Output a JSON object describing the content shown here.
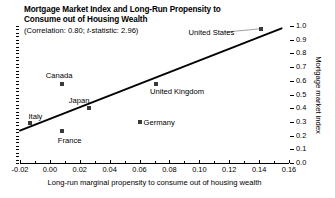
{
  "chart_data": {
    "type": "scatter",
    "title": "Mortgage Market Index and Long-Run Propensity to Consume out of Housing Wealth",
    "title_line1": "Mortgage Market Index and Long-Run Propensity to",
    "title_line2": "Consume out of Housing Wealth",
    "subtitle_prefix": "(Correlation: 0.80; ",
    "subtitle_italic": "t",
    "subtitle_suffix": "-statistic: 2.96)",
    "correlation": 0.8,
    "t_statistic": 2.96,
    "xlabel": "Long-run marginal propensity to consume out of housing wealth",
    "ylabel": "Mortgage market index",
    "xlim": [
      -0.02,
      0.16
    ],
    "ylim": [
      0.0,
      1.0
    ],
    "grid": false,
    "legend": "none",
    "y_axis_position": "right",
    "xticks": [
      -0.02,
      0.0,
      0.02,
      0.04,
      0.06,
      0.08,
      0.1,
      0.12,
      0.14,
      0.16
    ],
    "xticklabels": [
      "-0.02",
      "0.00",
      "0.02",
      "0.04",
      "0.06",
      "0.08",
      "0.10",
      "0.12",
      "0.14",
      "0.16"
    ],
    "yticks": [
      0.0,
      0.1,
      0.2,
      0.3,
      0.4,
      0.5,
      0.6,
      0.7,
      0.8,
      0.9,
      1.0
    ],
    "yticklabels": [
      "0.0",
      "0.1",
      "0.2",
      "0.3",
      "0.4",
      "0.5",
      "0.6",
      "0.7",
      "0.8",
      "0.9",
      "1.0"
    ],
    "points": [
      {
        "name": "Italy",
        "x": -0.013,
        "y": 0.29,
        "label_dx": -2,
        "label_dy": -11,
        "anchor": "start"
      },
      {
        "name": "France",
        "x": 0.008,
        "y": 0.23,
        "label_dx": -4,
        "label_dy": 5,
        "anchor": "start"
      },
      {
        "name": "Canada",
        "x": 0.008,
        "y": 0.58,
        "label_dx": -16,
        "label_dy": -13,
        "anchor": "start"
      },
      {
        "name": "Japan",
        "x": 0.026,
        "y": 0.4,
        "label_dx": -20,
        "label_dy": -12,
        "anchor": "start"
      },
      {
        "name": "Germany",
        "x": 0.06,
        "y": 0.3,
        "label_dx": 4,
        "label_dy": -4,
        "anchor": "start"
      },
      {
        "name": "United Kingdom",
        "x": 0.071,
        "y": 0.58,
        "label_dx": -6,
        "label_dy": 3,
        "anchor": "start"
      },
      {
        "name": "United States",
        "x": 0.141,
        "y": 0.98,
        "label_dx": -72,
        "label_dy": -1,
        "anchor": "start"
      }
    ],
    "trendline": {
      "type": "linear_fit",
      "x_start": -0.0205,
      "y_start": 0.235,
      "x_end": 0.1555,
      "y_end": 0.985
    },
    "leader_lines": [
      {
        "from": "United States",
        "x1": 0.141,
        "y1": 0.98,
        "x2": 0.117,
        "y2": 0.955
      }
    ]
  }
}
